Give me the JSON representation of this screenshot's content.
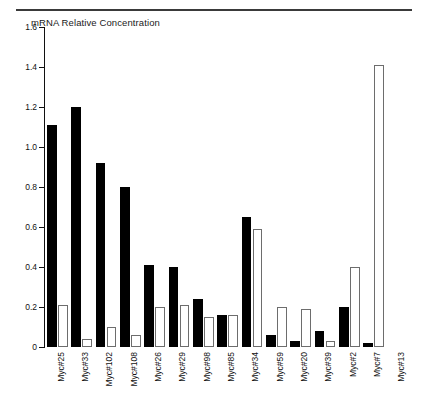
{
  "figure": {
    "title": "mRNA Relative Concentration",
    "top_rule": true
  },
  "axis": {
    "y_ticks": [
      "0",
      "0.2",
      "0.4",
      "0.6",
      "0.8",
      "1.0",
      "1.2",
      "1.4",
      "1.6"
    ],
    "y_min": 0,
    "y_max": 1.6,
    "x_labels": [
      "Myc#25",
      "Myc#33",
      "Myc#102",
      "Myc#108",
      "Myc#26",
      "Myc#29",
      "Myc#98",
      "Myc#85",
      "Myc#34",
      "Myc#59",
      "Myc#20",
      "Myc#39",
      "Myc#2",
      "Myc#7",
      "Myc#13"
    ]
  },
  "colors": {
    "solid_series": "#000000",
    "open_series": "#ffffff",
    "open_series_border": "#6d6d6d",
    "axis": "#111111",
    "rule": "#3a3a3a"
  },
  "chart_data": {
    "type": "bar",
    "title": "mRNA Relative Concentration",
    "xlabel": "",
    "ylabel": "mRNA Relative Concentration",
    "ylim": [
      0,
      1.6
    ],
    "ytick_values": [
      0,
      0.2,
      0.4,
      0.6,
      0.8,
      1.0,
      1.2,
      1.4,
      1.6
    ],
    "ytick_labels": [
      "0",
      "0.2",
      "0.4",
      "0.6",
      "0.8",
      "1.0",
      "1.2",
      "1.4",
      "1.6"
    ],
    "grid": false,
    "legend": null,
    "categories": [
      "Myc#25",
      "Myc#33",
      "Myc#102",
      "Myc#108",
      "Myc#26",
      "Myc#29",
      "Myc#98",
      "Myc#85",
      "Myc#34",
      "Myc#59",
      "Myc#20",
      "Myc#39",
      "Myc#2",
      "Myc#7",
      "Myc#13"
    ],
    "series": [
      {
        "name": "filled",
        "style": "solid-black",
        "values": [
          1.11,
          1.2,
          0.92,
          0.8,
          0.41,
          0.4,
          0.24,
          0.16,
          0.65,
          0.06,
          0.03,
          0.08,
          0.2,
          0.02,
          0.0
        ]
      },
      {
        "name": "open",
        "style": "white-outlined",
        "values": [
          0.21,
          0.04,
          0.1,
          0.06,
          0.2,
          0.21,
          0.15,
          0.16,
          0.59,
          0.2,
          0.19,
          0.03,
          0.4,
          1.41,
          0.0
        ]
      }
    ]
  }
}
